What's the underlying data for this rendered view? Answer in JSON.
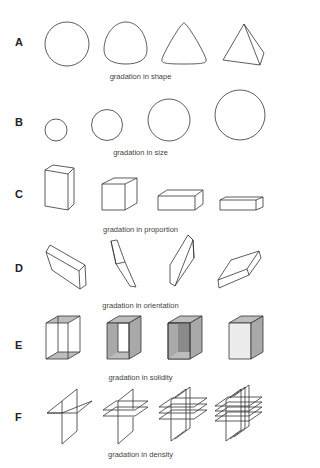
{
  "rows": [
    {
      "letter": "A",
      "caption": "gradation in shape",
      "items": [
        "circle",
        "rounded-triangle",
        "curved-triangle",
        "tetrahedron"
      ]
    },
    {
      "letter": "B",
      "caption": "gradation in size",
      "items": [
        "circle-small",
        "circle-medium",
        "circle-large",
        "circle-xlarge"
      ]
    },
    {
      "letter": "C",
      "caption": "gradation in proportion",
      "items": [
        "tall-box",
        "cube",
        "wide-box",
        "flat-box"
      ]
    },
    {
      "letter": "D",
      "caption": "gradation in orientation",
      "items": [
        "slab-tilted-right",
        "slab-near-vertical",
        "slab-tilted-left",
        "slab-tilted-flat"
      ]
    },
    {
      "letter": "E",
      "caption": "gradation in solidity",
      "items": [
        "wireframe-box",
        "open-shaded-box",
        "darker-shaded-box",
        "solid-box"
      ]
    },
    {
      "letter": "F",
      "caption": "gradation in density",
      "items": [
        "planes-1x1",
        "planes-1x2",
        "planes-2x3",
        "planes-3x4"
      ]
    }
  ],
  "colors": {
    "stroke": "#333333",
    "shade_light": "#bdbdbd",
    "shade_mid": "#a9a9a9",
    "shade_dark": "#8a8a8a",
    "shade_face": "#ececec"
  }
}
